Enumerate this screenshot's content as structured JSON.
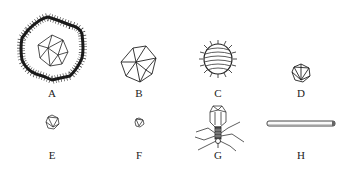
{
  "diagram": {
    "type": "virus-morphology-comparison",
    "items": [
      {
        "id": "A",
        "label": "A",
        "shape": "enveloped-icosahedral-large",
        "icon": "enveloped-icosahedron-icon"
      },
      {
        "id": "B",
        "label": "B",
        "shape": "icosahedral",
        "icon": "icosahedron-icon"
      },
      {
        "id": "C",
        "label": "C",
        "shape": "enveloped-helical-spiked",
        "icon": "spiked-helical-virus-icon"
      },
      {
        "id": "D",
        "label": "D",
        "shape": "small-icosahedral",
        "icon": "small-icosahedron-icon"
      },
      {
        "id": "E",
        "label": "E",
        "shape": "tiny-icosahedral",
        "icon": "tiny-icosahedron-icon"
      },
      {
        "id": "F",
        "label": "F",
        "shape": "tiny-icosahedral-smallest",
        "icon": "smallest-icosahedron-icon"
      },
      {
        "id": "G",
        "label": "G",
        "shape": "bacteriophage",
        "icon": "bacteriophage-icon"
      },
      {
        "id": "H",
        "label": "H",
        "shape": "rod-helical",
        "icon": "rod-virus-icon"
      }
    ]
  }
}
